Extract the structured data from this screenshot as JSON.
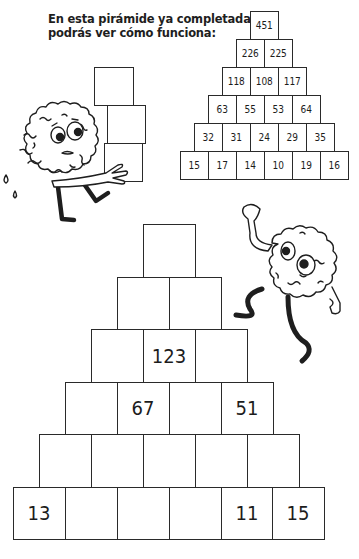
{
  "intro": {
    "line1": "En esta pirámide ya completada",
    "line2": "podrás ver cómo funciona:"
  },
  "example_pyramid": {
    "rows": [
      [
        "451"
      ],
      [
        "226",
        "225"
      ],
      [
        "118",
        "108",
        "117"
      ],
      [
        "63",
        "55",
        "53",
        "64"
      ],
      [
        "32",
        "31",
        "24",
        "29",
        "35"
      ],
      [
        "15",
        "17",
        "14",
        "10",
        "19",
        "16"
      ]
    ]
  },
  "exercise_pyramid": {
    "rows": [
      [
        ""
      ],
      [
        "",
        ""
      ],
      [
        "",
        "123",
        ""
      ],
      [
        "",
        "67",
        "",
        "51"
      ],
      [
        "",
        "",
        "",
        "",
        ""
      ],
      [
        "13",
        "",
        "",
        "",
        "11",
        "15"
      ]
    ]
  },
  "illustrations": {
    "left": "brain-character-carrying-boxes-icon",
    "right": "brain-character-climbing-icon"
  }
}
